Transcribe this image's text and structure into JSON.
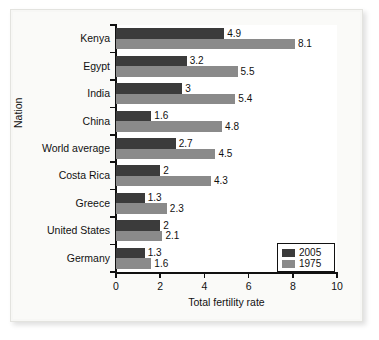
{
  "chart_data": {
    "type": "bar",
    "orientation": "horizontal",
    "title": "",
    "xlabel": "Total fertility rate",
    "ylabel": "Nation",
    "xlim": [
      0,
      10
    ],
    "xticks": [
      "0",
      "2",
      "4",
      "6",
      "8",
      "10"
    ],
    "grid": false,
    "legend_position": "bottom-right",
    "categories": [
      "Kenya",
      "Egypt",
      "India",
      "China",
      "World average",
      "Costa Rica",
      "Greece",
      "United States",
      "Germany"
    ],
    "series": [
      {
        "name": "2005",
        "color": "#3b3b3b",
        "values": [
          4.9,
          3.2,
          3,
          1.6,
          2.7,
          2,
          1.3,
          2,
          1.3
        ],
        "labels": [
          "4.9",
          "3.2",
          "3",
          "1.6",
          "2.7",
          "2",
          "1.3",
          "2",
          "1.3"
        ]
      },
      {
        "name": "1975",
        "color": "#8a8a8a",
        "values": [
          8.1,
          5.5,
          5.4,
          4.8,
          4.5,
          4.3,
          2.3,
          2.1,
          1.6
        ],
        "labels": [
          "8.1",
          "5.5",
          "5.4",
          "4.8",
          "4.5",
          "4.3",
          "2.3",
          "2.1",
          "1.6"
        ]
      }
    ]
  },
  "legend": {
    "entries": [
      {
        "label": "2005",
        "color": "#3b3b3b"
      },
      {
        "label": "1975",
        "color": "#8a8a8a"
      }
    ]
  }
}
